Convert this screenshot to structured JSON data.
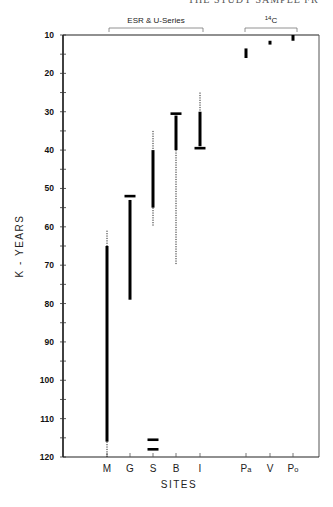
{
  "page": {
    "running_header": "THE STUDY SAMPLE FR"
  },
  "chart_data": {
    "type": "range",
    "title": "",
    "xlabel": "SITES",
    "ylabel": "K - YEARS",
    "ylim": [
      10,
      120
    ],
    "y_inverted": true,
    "y_ticks": [
      10,
      20,
      30,
      40,
      50,
      60,
      70,
      80,
      90,
      100,
      110,
      120
    ],
    "categories": [
      "M",
      "G",
      "S",
      "B",
      "I",
      "Pa",
      "V",
      "Po"
    ],
    "groups": [
      {
        "label": "ESR & U-Series",
        "sites": [
          "M",
          "G",
          "S",
          "B",
          "I"
        ]
      },
      {
        "label": "14C",
        "label_super": "14",
        "label_base": "C",
        "sites": [
          "Pa",
          "V",
          "Po"
        ]
      }
    ],
    "series": [
      {
        "site": "M",
        "solid": [
          65,
          116
        ],
        "dotted": [
          [
            61,
            65
          ],
          [
            116,
            120
          ]
        ],
        "caps": []
      },
      {
        "site": "G",
        "solid": [
          53,
          79
        ],
        "dotted": [],
        "caps": [
          52
        ]
      },
      {
        "site": "S",
        "solid": [
          40,
          55
        ],
        "dotted": [
          [
            35,
            40
          ],
          [
            55,
            60
          ]
        ],
        "caps": [
          115.5,
          118
        ]
      },
      {
        "site": "B",
        "solid": [
          31,
          40
        ],
        "dotted": [
          [
            40,
            70
          ]
        ],
        "caps": [
          30.5
        ]
      },
      {
        "site": "I",
        "solid": [
          30,
          39
        ],
        "dotted": [
          [
            25,
            30
          ]
        ],
        "caps": [
          39.5
        ]
      },
      {
        "site": "Pa",
        "solid": [
          13.5,
          16
        ],
        "dotted": [],
        "caps": []
      },
      {
        "site": "V",
        "solid": [
          11.5,
          12.5
        ],
        "dotted": [],
        "caps": []
      },
      {
        "site": "Po",
        "solid": [
          10,
          11.5
        ],
        "dotted": [],
        "caps": []
      }
    ],
    "grid": false,
    "legend": null
  }
}
